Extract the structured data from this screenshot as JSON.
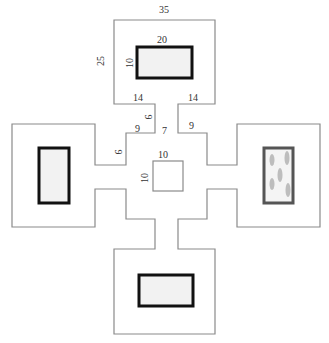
{
  "diagram": {
    "title": "",
    "top_room": {
      "width_label": "35",
      "height_label": "25",
      "window_width_label": "20",
      "window_height_label": "10"
    },
    "corridor_labels": {
      "shoulder_left": "14",
      "shoulder_right": "14",
      "neck": "9",
      "step_left": "9",
      "step_right": "9",
      "gap": "7",
      "side_step": "9"
    },
    "center_square": {
      "width_label": "10",
      "height_label": "10"
    },
    "rooms": [
      {
        "id": "top",
        "window": "plain"
      },
      {
        "id": "left",
        "window": "plain"
      },
      {
        "id": "right",
        "window": "with-figures"
      },
      {
        "id": "bottom",
        "window": "plain"
      }
    ],
    "colors": {
      "outline": "#8a8a8a",
      "window_border": "#111111",
      "window_fill": "#f2f2f2",
      "figure": "#bdbdbd"
    }
  }
}
